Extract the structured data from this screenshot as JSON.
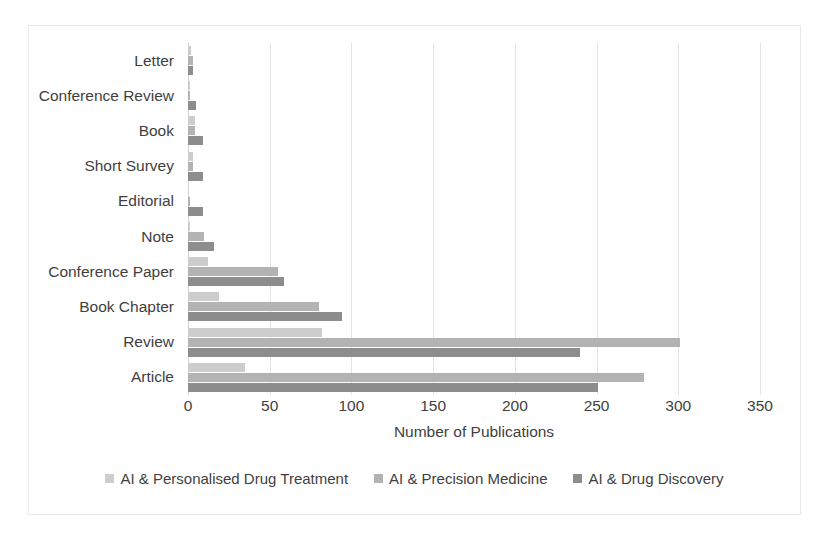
{
  "chart_data": {
    "type": "bar",
    "orientation": "horizontal",
    "title": "",
    "xlabel": "Number of Publications",
    "ylabel": "",
    "xlim": [
      0,
      350
    ],
    "xticks": [
      "0",
      "50",
      "100",
      "150",
      "200",
      "250",
      "300",
      "350"
    ],
    "grid": true,
    "grid_axis": "x",
    "legend_position": "bottom",
    "categories": [
      "Article",
      "Review",
      "Book Chapter",
      "Conference Paper",
      "Note",
      "Editorial",
      "Short Survey",
      "Book",
      "Conference Review",
      "Letter"
    ],
    "series": [
      {
        "name": "AI & Personalised Drug Treatment",
        "color": "#cdcdcd",
        "values": [
          35,
          82,
          19,
          12,
          1,
          0,
          3,
          4,
          1,
          2
        ]
      },
      {
        "name": "AI & Precision Medicine",
        "color": "#b3b3b3",
        "values": [
          279,
          301,
          80,
          55,
          10,
          1,
          3,
          4,
          1,
          3
        ]
      },
      {
        "name": "AI & Drug Discovery",
        "color": "#8d8d8d",
        "values": [
          251,
          240,
          94,
          59,
          16,
          9,
          9,
          9,
          5,
          3
        ]
      }
    ]
  },
  "axis": {
    "x_title": "Number of Publications"
  },
  "colors": {
    "series_light": "#cdcdcd",
    "series_medium": "#b3b3b3",
    "series_dark": "#8d8d8d",
    "gridline": "#e4e4e4",
    "frame": "#e9e9e9",
    "text": "#3f3f3f",
    "background": "#ffffff"
  }
}
